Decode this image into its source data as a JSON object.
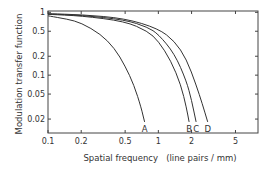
{
  "chart_data": {
    "type": "line",
    "title": "",
    "xlabel": "Spatial frequency   (line pairs / mm)",
    "ylabel": "Modulation transfer function",
    "xscale": "log",
    "yscale": "log",
    "xlim": [
      0.1,
      8
    ],
    "ylim": [
      0.012,
      1.05
    ],
    "xticks": [
      0.1,
      0.2,
      0.5,
      1,
      2,
      5
    ],
    "xtick_labels": [
      "0.1",
      "0.2",
      "0.5",
      "1",
      "2",
      "5"
    ],
    "yticks": [
      1,
      0.5,
      0.2,
      0.1,
      0.05,
      0.02
    ],
    "ytick_labels": [
      "1",
      "0.5",
      "0.2",
      "0.1",
      "0.05",
      "0.02"
    ],
    "grid": false,
    "legend": "inline labels at curve ends",
    "series": [
      {
        "name": "A",
        "x": [
          0.1,
          0.15,
          0.2,
          0.3,
          0.4,
          0.5,
          0.6,
          0.7,
          0.75
        ],
        "y": [
          0.88,
          0.78,
          0.68,
          0.45,
          0.27,
          0.14,
          0.07,
          0.03,
          0.018
        ]
      },
      {
        "name": "B",
        "x": [
          0.1,
          0.2,
          0.5,
          0.8,
          1.0,
          1.3,
          1.6,
          1.8,
          1.9
        ],
        "y": [
          0.93,
          0.88,
          0.72,
          0.5,
          0.35,
          0.17,
          0.07,
          0.03,
          0.018
        ]
      },
      {
        "name": "C",
        "x": [
          0.1,
          0.2,
          0.5,
          0.8,
          1.0,
          1.4,
          1.8,
          2.0,
          2.2
        ],
        "y": [
          0.94,
          0.9,
          0.76,
          0.58,
          0.45,
          0.22,
          0.08,
          0.04,
          0.018
        ]
      },
      {
        "name": "D",
        "x": [
          0.1,
          0.2,
          0.5,
          1.0,
          1.4,
          1.8,
          2.2,
          2.5,
          2.8
        ],
        "y": [
          0.95,
          0.92,
          0.8,
          0.55,
          0.35,
          0.18,
          0.07,
          0.035,
          0.018
        ]
      }
    ]
  }
}
